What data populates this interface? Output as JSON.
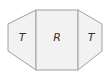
{
  "diagram": {
    "type": "net",
    "faces": [
      {
        "id": "left",
        "label": "T",
        "shape": "trapezoid"
      },
      {
        "id": "center",
        "label": "R",
        "shape": "rectangle"
      },
      {
        "id": "right",
        "label": "T",
        "shape": "trapezoid"
      }
    ],
    "colors": {
      "fill": "#f2f2f2",
      "stroke": "#a0a0a0",
      "text": "#333333"
    }
  }
}
